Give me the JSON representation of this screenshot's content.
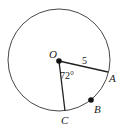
{
  "diagram": {
    "type": "circle-geometry",
    "center_label": "O",
    "points": [
      {
        "label": "A",
        "on_circle": true,
        "marked": false
      },
      {
        "label": "B",
        "on_circle": true,
        "marked": true
      },
      {
        "label": "C",
        "on_circle": true,
        "marked": false
      }
    ],
    "radius_label": "5",
    "angle_label": "72°",
    "angle_between": [
      "OA",
      "OC"
    ]
  }
}
